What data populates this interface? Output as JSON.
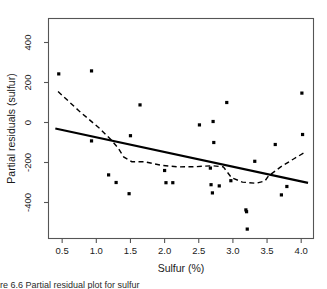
{
  "figure": {
    "background": "#ffffff",
    "frame_color": "#555555",
    "point_color": "#000000",
    "line_color": "#000000",
    "caption_fragment": "re 6.6  Partial residual plot for sulfur"
  },
  "chart_data": {
    "type": "scatter",
    "title": "",
    "xlabel": "Sulfur (%)",
    "ylabel": "Partial residuals (sulfur)",
    "xlim": [
      0.3,
      4.18
    ],
    "ylim": [
      -580,
      520
    ],
    "xticks": [
      0.5,
      1.0,
      1.5,
      2.0,
      2.5,
      3.0,
      3.5,
      4.0
    ],
    "xticklabels": [
      "0.5",
      "1.0",
      "1.5",
      "2.0",
      "2.5",
      "3.0",
      "3.5",
      "4.0"
    ],
    "yticks": [
      400,
      200,
      0,
      -200,
      -400
    ],
    "yticklabels": [
      "400",
      "200",
      "0",
      "-200",
      "-400"
    ],
    "grid": false,
    "legend": null,
    "points": [
      {
        "x": 0.45,
        "y": 243
      },
      {
        "x": 0.93,
        "y": 258
      },
      {
        "x": 0.93,
        "y": -92
      },
      {
        "x": 1.18,
        "y": -262
      },
      {
        "x": 1.29,
        "y": -300
      },
      {
        "x": 1.48,
        "y": -356
      },
      {
        "x": 1.5,
        "y": -66
      },
      {
        "x": 1.64,
        "y": 88
      },
      {
        "x": 2.0,
        "y": -240
      },
      {
        "x": 2.02,
        "y": -301
      },
      {
        "x": 2.12,
        "y": -301
      },
      {
        "x": 2.51,
        "y": -12
      },
      {
        "x": 2.67,
        "y": -228
      },
      {
        "x": 2.68,
        "y": -311
      },
      {
        "x": 2.7,
        "y": -352
      },
      {
        "x": 2.71,
        "y": 5
      },
      {
        "x": 2.72,
        "y": -100
      },
      {
        "x": 2.8,
        "y": -317
      },
      {
        "x": 2.91,
        "y": 100
      },
      {
        "x": 2.97,
        "y": -291
      },
      {
        "x": 3.19,
        "y": -437
      },
      {
        "x": 3.2,
        "y": -446
      },
      {
        "x": 3.21,
        "y": -533
      },
      {
        "x": 3.32,
        "y": -194
      },
      {
        "x": 3.62,
        "y": -110
      },
      {
        "x": 3.71,
        "y": -362
      },
      {
        "x": 3.79,
        "y": -320
      },
      {
        "x": 4.01,
        "y": 147
      },
      {
        "x": 4.02,
        "y": -60
      }
    ],
    "fit_line": {
      "style": "solid",
      "points": [
        {
          "x": 0.4,
          "y": -30
        },
        {
          "x": 4.1,
          "y": -302
        }
      ]
    },
    "smooth_curve": {
      "style": "dashed",
      "points": [
        {
          "x": 0.44,
          "y": 155
        },
        {
          "x": 0.74,
          "y": 60
        },
        {
          "x": 1.05,
          "y": -30
        },
        {
          "x": 1.22,
          "y": -88
        },
        {
          "x": 1.32,
          "y": -128
        },
        {
          "x": 1.4,
          "y": -172
        },
        {
          "x": 1.52,
          "y": -196
        },
        {
          "x": 1.7,
          "y": -196
        },
        {
          "x": 1.95,
          "y": -214
        },
        {
          "x": 2.2,
          "y": -222
        },
        {
          "x": 2.45,
          "y": -221
        },
        {
          "x": 2.7,
          "y": -216
        },
        {
          "x": 2.86,
          "y": -222
        },
        {
          "x": 2.98,
          "y": -276
        },
        {
          "x": 3.14,
          "y": -298
        },
        {
          "x": 3.34,
          "y": -304
        },
        {
          "x": 3.47,
          "y": -292
        },
        {
          "x": 3.52,
          "y": -268
        },
        {
          "x": 3.7,
          "y": -222
        },
        {
          "x": 3.9,
          "y": -180
        },
        {
          "x": 4.06,
          "y": -148
        }
      ]
    }
  }
}
